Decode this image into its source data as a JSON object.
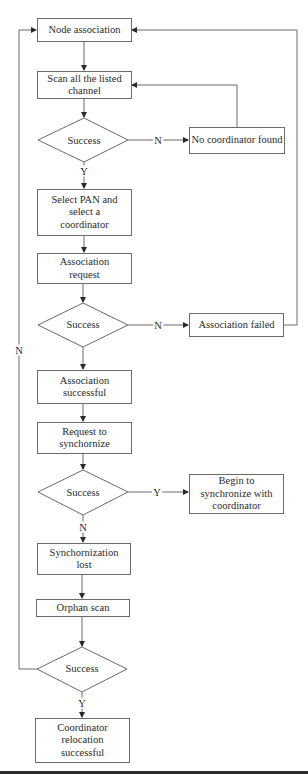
{
  "diagram": {
    "type": "flowchart",
    "nodes": {
      "node_association": "Node association",
      "scan_channels": "Scan all the listed channel",
      "decision_1": "Success",
      "no_coordinator": "No coordinator found",
      "select_pan": "Select PAN and select a coordinator",
      "association_request": "Association request",
      "decision_2": "Success",
      "association_failed": "Association failed",
      "association_successful": "Association successful",
      "request_sync": "Request to synchornize",
      "decision_3": "Success",
      "begin_sync": "Begin to synchronize with coordinator",
      "sync_lost": "Synchornization lost",
      "orphan_scan": "Orphan scan",
      "decision_4": "Success",
      "coordinator_relocation": "Coordinator relocation successful"
    },
    "edge_labels": {
      "d1_no": "N",
      "d1_yes": "Y",
      "d2_no": "N",
      "d3_yes": "Y",
      "d3_no": "N",
      "d4_no": "N",
      "d4_yes": "Y"
    },
    "colors": {
      "stroke": "#6a6a6a",
      "text": "#2a2a2a",
      "rule": "#2b2b2b"
    }
  }
}
